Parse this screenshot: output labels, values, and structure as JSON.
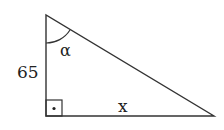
{
  "diagram": {
    "type": "right-triangle",
    "stroke_color": "#333333",
    "background": "#ffffff",
    "vertices": {
      "top": [
        46,
        15
      ],
      "right_angle": [
        46,
        116
      ],
      "bottom_right": [
        214,
        116
      ]
    },
    "labels": {
      "vertical_side": "65",
      "horizontal_side": "x",
      "angle": "α"
    },
    "right_angle_marker": {
      "shape": "square-with-dot"
    }
  }
}
